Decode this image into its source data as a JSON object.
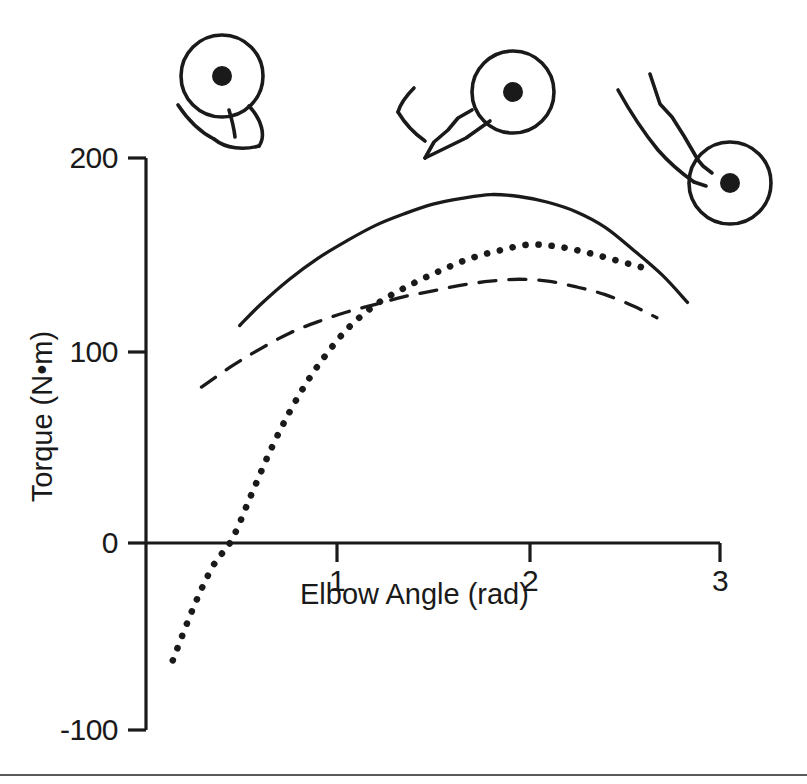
{
  "figure": {
    "name": "elbow-torque-angle-figure",
    "background": "#ffffff",
    "ink": "#1a1a1a"
  },
  "axis_titles": {
    "x": "Elbow Angle (rad)",
    "y": "Torque (N•m)"
  },
  "y_ticks": [
    {
      "label": "200",
      "value": 200
    },
    {
      "label": "100",
      "value": 100
    },
    {
      "label": "0",
      "value": 0
    },
    {
      "label": "-100",
      "value": -100
    }
  ],
  "x_ticks": [
    {
      "label": "1",
      "value": 1
    },
    {
      "label": "2",
      "value": 2
    },
    {
      "label": "3",
      "value": 3
    }
  ],
  "arm_diagrams": [
    {
      "name": "arm-posture-flexed",
      "angle_rad": 0.6,
      "description": "flexed elbow, forearm folded toward shoulder"
    },
    {
      "name": "arm-posture-mid-range",
      "angle_rad": 1.7,
      "description": "mid-range elbow angle, forearm at about right angle"
    },
    {
      "name": "arm-posture-extended",
      "angle_rad": 2.8,
      "description": "extended elbow, forearm nearly in line with upper arm"
    }
  ],
  "chart_data": {
    "type": "line",
    "title": "",
    "xlabel": "Elbow Angle (rad)",
    "ylabel": "Torque (N•m)",
    "xlim": [
      0,
      3.0
    ],
    "ylim": [
      -100,
      200
    ],
    "xticks": [
      1,
      2,
      3
    ],
    "yticks": [
      -100,
      0,
      100,
      200
    ],
    "grid": false,
    "legend": "none",
    "series": [
      {
        "name": "solid-curve",
        "style": "solid",
        "points": [
          [
            0.49,
            113
          ],
          [
            0.6,
            124
          ],
          [
            0.75,
            137
          ],
          [
            0.9,
            148
          ],
          [
            1.05,
            157
          ],
          [
            1.2,
            165
          ],
          [
            1.35,
            171
          ],
          [
            1.5,
            176
          ],
          [
            1.65,
            179
          ],
          [
            1.8,
            181
          ],
          [
            1.95,
            180
          ],
          [
            2.1,
            177
          ],
          [
            2.25,
            172
          ],
          [
            2.4,
            164
          ],
          [
            2.55,
            152
          ],
          [
            2.7,
            139
          ],
          [
            2.83,
            125
          ]
        ]
      },
      {
        "name": "dotted-curve",
        "style": "dotted",
        "points": [
          [
            0.14,
            -61
          ],
          [
            0.25,
            -33
          ],
          [
            0.35,
            -12
          ],
          [
            0.45,
            2
          ],
          [
            0.55,
            25
          ],
          [
            0.65,
            48
          ],
          [
            0.75,
            68
          ],
          [
            0.85,
            85
          ],
          [
            0.95,
            99
          ],
          [
            1.05,
            111
          ],
          [
            1.15,
            120
          ],
          [
            1.25,
            127
          ],
          [
            1.4,
            135
          ],
          [
            1.55,
            142
          ],
          [
            1.7,
            148
          ],
          [
            1.85,
            152
          ],
          [
            2.0,
            155
          ],
          [
            2.15,
            154
          ],
          [
            2.3,
            151
          ],
          [
            2.45,
            147
          ],
          [
            2.6,
            143
          ]
        ]
      },
      {
        "name": "dashed-curve",
        "style": "dashed",
        "points": [
          [
            0.29,
            81
          ],
          [
            0.45,
            92
          ],
          [
            0.6,
            101
          ],
          [
            0.75,
            109
          ],
          [
            0.9,
            115
          ],
          [
            1.05,
            120
          ],
          [
            1.2,
            124
          ],
          [
            1.35,
            128
          ],
          [
            1.5,
            131
          ],
          [
            1.65,
            134
          ],
          [
            1.8,
            136
          ],
          [
            1.95,
            137
          ],
          [
            2.1,
            136
          ],
          [
            2.25,
            133
          ],
          [
            2.4,
            129
          ],
          [
            2.55,
            123
          ],
          [
            2.67,
            117
          ]
        ]
      }
    ]
  }
}
